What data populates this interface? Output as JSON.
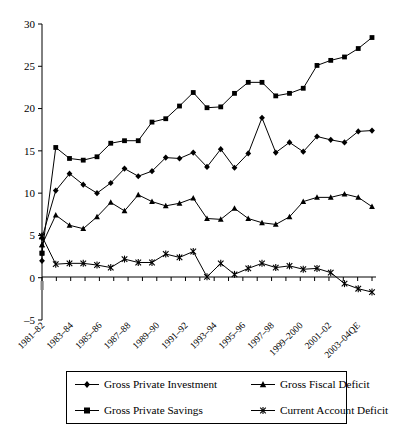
{
  "chart_data": {
    "type": "line",
    "title": "",
    "subtitle": "",
    "xlabel": "",
    "ylabel": "",
    "ylim": [
      -5,
      30
    ],
    "yticks": [
      -5,
      0,
      5,
      10,
      15,
      20,
      25,
      30
    ],
    "ytick_labels": [
      "–5",
      "0",
      "5",
      "10",
      "15",
      "20",
      "25",
      "30"
    ],
    "grid": false,
    "legend_position": "bottom",
    "x": [
      "1981–82",
      "1982–83",
      "1983–84",
      "1984–85",
      "1985–86",
      "1986–87",
      "1987–88",
      "1988–89",
      "1989–90",
      "1990–91",
      "1991–92",
      "1992–93",
      "1993–94",
      "1994–95",
      "1995–96",
      "1996–97",
      "1997–98",
      "1998–99",
      "1999–2000",
      "2000–01",
      "2001–02",
      "2002–03",
      "2003–04QE",
      "2004–05"
    ],
    "xtick_labels_shown": [
      "1981–82",
      "1983–84",
      "1985–86",
      "1987–88",
      "1989–90",
      "1991–92",
      "1993–94",
      "1995–96",
      "1997–98",
      "1999–2000",
      "2001–02",
      "2003–04QE"
    ],
    "xtick_label_interval": 2,
    "series": [
      {
        "name": "Gross Private Investment",
        "marker": "diamond",
        "values": [
          4.7,
          10.3,
          12.3,
          11.0,
          10.0,
          11.2,
          12.9,
          12.0,
          12.6,
          14.2,
          14.1,
          14.8,
          13.1,
          15.2,
          13.0,
          14.7,
          18.9,
          14.8,
          16.0,
          14.9,
          16.7,
          16.3,
          16.0,
          17.3
        ]
      },
      {
        "name": "Gross Fiscal Deficit",
        "marker": "triangle",
        "values": [
          3.9,
          7.4,
          6.2,
          5.8,
          7.2,
          8.9,
          7.9,
          9.8,
          9.0,
          8.5,
          8.8,
          9.4,
          7.0,
          6.9,
          8.2,
          7.0,
          6.5,
          6.3,
          7.2,
          9.0,
          9.5,
          9.5,
          9.9,
          9.5
        ]
      },
      {
        "name": "Gross Private Savings",
        "marker": "square",
        "values": [
          2.9,
          15.4,
          14.1,
          13.9,
          14.3,
          15.9,
          16.2,
          16.2,
          18.4,
          18.8,
          20.3,
          21.9,
          20.1,
          20.2,
          21.8,
          23.1,
          23.1,
          21.5,
          21.8,
          22.4,
          25.1,
          25.7,
          26.1,
          27.1
        ]
      },
      {
        "name": "Current Account Deficit",
        "marker": "star",
        "values": [
          4.9,
          1.6,
          1.7,
          1.7,
          1.5,
          1.2,
          2.2,
          1.8,
          1.8,
          2.8,
          2.4,
          3.1,
          0.1,
          1.7,
          0.4,
          1.1,
          1.7,
          1.2,
          1.4,
          1.0,
          1.1,
          0.6,
          -0.7,
          -1.3
        ]
      }
    ],
    "extra_endpoints": {
      "Gross Private Investment": 17.4,
      "Gross Fiscal Deficit": 8.4,
      "Gross Private Savings": 28.4,
      "Current Account Deficit": -1.7
    },
    "first_extra_points": {
      "Gross Private Investment": 2.0,
      "Gross Private Savings": 2.9,
      "Gross Fiscal Deficit": 3.9,
      "Current Account Deficit": 4.9
    }
  },
  "legend": {
    "items": [
      {
        "label": "Gross Private Investment",
        "marker": "diamond"
      },
      {
        "label": "Gross Fiscal Deficit",
        "marker": "triangle"
      },
      {
        "label": "Gross Private Savings",
        "marker": "square"
      },
      {
        "label": "Current Account Deficit",
        "marker": "star"
      }
    ]
  },
  "colors": {
    "ink": "#000000",
    "background": "#ffffff"
  }
}
